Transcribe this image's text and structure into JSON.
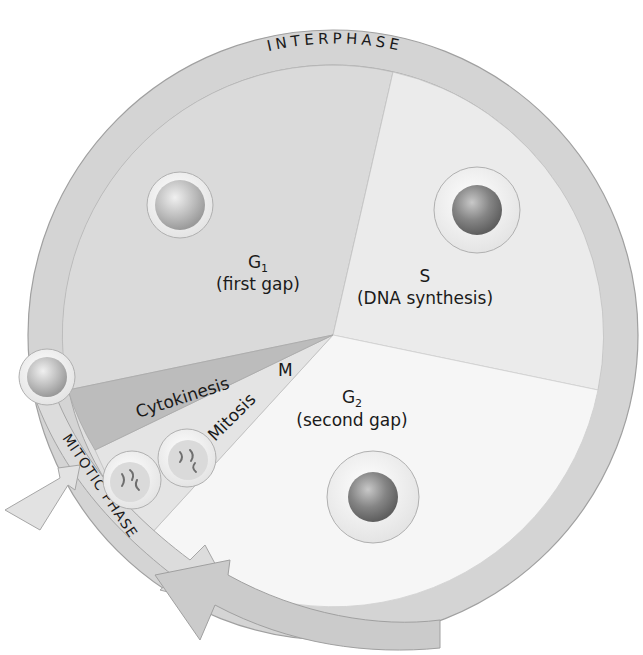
{
  "diagram": {
    "title_ring": "INTERPHASE",
    "mitotic_label": "MITOTIC PHASE",
    "phases": [
      {
        "id": "g1",
        "name": "G",
        "subscript": "1",
        "description": "(first gap)",
        "fill": "#dedede"
      },
      {
        "id": "s",
        "name": "S",
        "description": "(DNA synthesis)",
        "fill": "#ececec"
      },
      {
        "id": "g2",
        "name": "G",
        "subscript": "2",
        "description": "(second gap)",
        "fill": "#f6f6f6"
      },
      {
        "id": "m",
        "name": "M",
        "fill": "#cfcfcf"
      }
    ],
    "m_subphases": [
      {
        "id": "cytokinesis",
        "label": "Cytokinesis",
        "fill": "#bdbdbd"
      },
      {
        "id": "mitosis",
        "label": "Mitosis",
        "fill": "#e2e2e2"
      }
    ],
    "colors": {
      "ring": "#d2d2d2",
      "ring_stroke": "#a8a8a8",
      "nucleus_light": "#c4c4c4",
      "nucleus_dark": "#8a8a8a"
    }
  }
}
